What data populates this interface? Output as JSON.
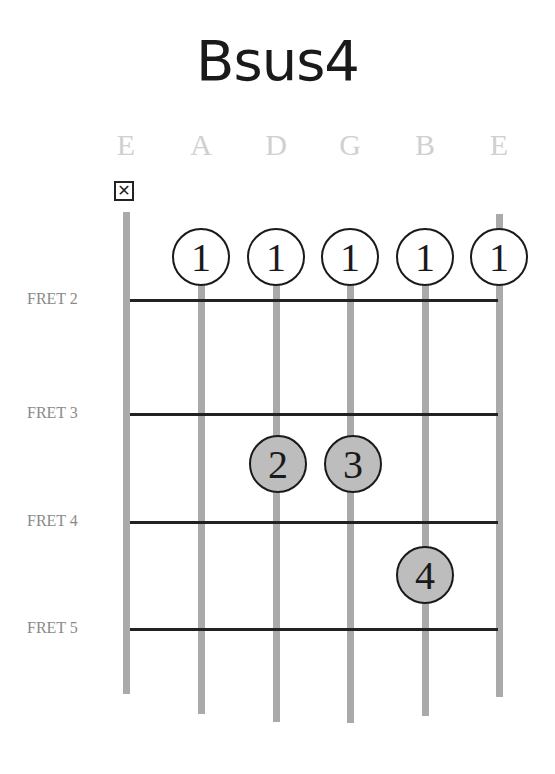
{
  "chord": {
    "name": "Bsus4"
  },
  "strings": [
    {
      "name": "E",
      "x": 126,
      "top": 212,
      "bottom": 694
    },
    {
      "name": "A",
      "x": 201,
      "top": 285,
      "bottom": 714
    },
    {
      "name": "D",
      "x": 276,
      "top": 285,
      "bottom": 722
    },
    {
      "name": "G",
      "x": 350,
      "top": 285,
      "bottom": 723
    },
    {
      "name": "B",
      "x": 425,
      "top": 285,
      "bottom": 716
    },
    {
      "name": "E",
      "x": 499,
      "top": 214,
      "bottom": 697
    }
  ],
  "muted": {
    "string": "E (low)",
    "symbol": "✕"
  },
  "frets": [
    {
      "label": "FRET 2",
      "y": 300
    },
    {
      "label": "FRET 3",
      "y": 414
    },
    {
      "label": "FRET 4",
      "y": 522
    },
    {
      "label": "FRET 5",
      "y": 629
    }
  ],
  "fingers": [
    {
      "finger": "1",
      "string": "A",
      "x": 201,
      "y": 257,
      "style": "open"
    },
    {
      "finger": "1",
      "string": "D",
      "x": 276,
      "y": 257,
      "style": "open"
    },
    {
      "finger": "1",
      "string": "G",
      "x": 350,
      "y": 257,
      "style": "open"
    },
    {
      "finger": "1",
      "string": "B",
      "x": 425,
      "y": 257,
      "style": "open"
    },
    {
      "finger": "1",
      "string": "E",
      "x": 499,
      "y": 257,
      "style": "open"
    },
    {
      "finger": "2",
      "string": "D",
      "x": 278,
      "y": 464,
      "style": "filled"
    },
    {
      "finger": "3",
      "string": "G",
      "x": 353,
      "y": 464,
      "style": "filled"
    },
    {
      "finger": "4",
      "string": "B",
      "x": 425,
      "y": 575,
      "style": "filled"
    }
  ],
  "colors": {
    "string": "#aaaaaa",
    "fret": "#222222",
    "filled_dot": "#bdbdbd",
    "string_label": "#d0d0d0",
    "fret_label": "#8a8a8a"
  }
}
